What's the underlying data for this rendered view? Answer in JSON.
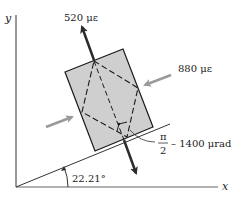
{
  "diagram": {
    "type": "strain-element",
    "axes": {
      "x_label": "x",
      "y_label": "y"
    },
    "labels": {
      "normal_strain_1": "520 με",
      "normal_strain_2": "880 με",
      "angle": "22.21°",
      "shear_pi": "π",
      "shear_den": "2",
      "shear_rest": "– 1400 μrad"
    },
    "colors": {
      "element_fill": "#cfcfcf",
      "outline": "#1a1a1a",
      "tension_arrow": "#2b2b2b",
      "compression_arrow": "#9a9a9a"
    }
  }
}
